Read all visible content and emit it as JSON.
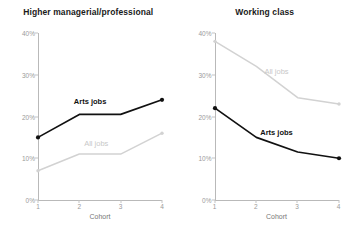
{
  "figure": {
    "background": "#ffffff",
    "arts_color": "#111111",
    "all_color": "#d2d2d2",
    "axis_color": "#b9b9b9",
    "tick_text_color": "#9a9a9a"
  },
  "axis": {
    "ylim": [
      0,
      40
    ],
    "yticks": [
      "0%",
      "10%",
      "20%",
      "30%",
      "40%"
    ],
    "ytick_values": [
      0,
      10,
      20,
      30,
      40
    ],
    "xticks": [
      "1",
      "2",
      "3",
      "4"
    ],
    "xlabel": "Cohort"
  },
  "panels": [
    {
      "title": "Higher managerial/professional",
      "labels": {
        "arts": "Arts jobs",
        "all": "All jobs"
      }
    },
    {
      "title": "Working class",
      "labels": {
        "arts": "Arts jobs",
        "all": "All jobs"
      }
    }
  ],
  "chart_data": [
    {
      "type": "line",
      "title": "Higher managerial/professional",
      "xlabel": "Cohort",
      "ylabel": "",
      "x": [
        1,
        2,
        3,
        4
      ],
      "categories": [
        "1",
        "2",
        "3",
        "4"
      ],
      "ylim": [
        0,
        40
      ],
      "yticks": [
        0,
        10,
        20,
        30,
        40
      ],
      "ytick_labels": [
        "0%",
        "10%",
        "20%",
        "30%",
        "40%"
      ],
      "grid": false,
      "legend": "inline-series-labels",
      "series": [
        {
          "name": "Arts jobs",
          "color": "#111111",
          "values": [
            15.0,
            20.5,
            20.5,
            24.0
          ],
          "markers": "endpoints"
        },
        {
          "name": "All jobs",
          "color": "#d2d2d2",
          "values": [
            7.0,
            11.0,
            11.0,
            16.0
          ],
          "markers": "endpoints"
        }
      ]
    },
    {
      "type": "line",
      "title": "Working class",
      "xlabel": "Cohort",
      "ylabel": "",
      "x": [
        1,
        2,
        3,
        4
      ],
      "categories": [
        "1",
        "2",
        "3",
        "4"
      ],
      "ylim": [
        0,
        40
      ],
      "yticks": [
        0,
        10,
        20,
        30,
        40
      ],
      "ytick_labels": [
        "0%",
        "10%",
        "20%",
        "30%",
        "40%"
      ],
      "grid": false,
      "legend": "inline-series-labels",
      "series": [
        {
          "name": "All jobs",
          "color": "#d2d2d2",
          "values": [
            38.0,
            32.0,
            24.5,
            23.0
          ],
          "markers": "endpoints"
        },
        {
          "name": "Arts jobs",
          "color": "#111111",
          "values": [
            22.0,
            15.0,
            11.5,
            10.0
          ],
          "markers": "endpoints"
        }
      ]
    }
  ]
}
